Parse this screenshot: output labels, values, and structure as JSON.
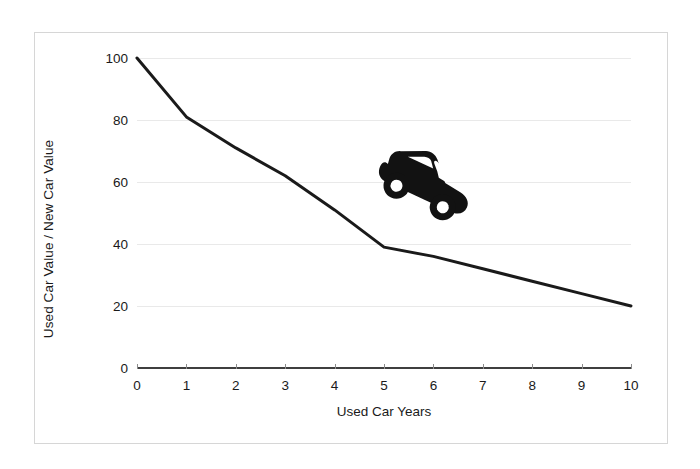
{
  "chart_data": {
    "type": "line",
    "title": "",
    "subtitle": "",
    "xlabel": "Used Car Years",
    "ylabel": "Used Car Value / New Car Value",
    "x": [
      0,
      1,
      2,
      3,
      4,
      5,
      6,
      7,
      8,
      9,
      10
    ],
    "values": [
      100,
      81,
      71,
      62,
      51,
      39,
      36,
      32,
      28,
      24,
      20
    ],
    "series": [
      {
        "name": "Used Car Value / New Car Value",
        "color": "#1a1a1a",
        "values": [
          100,
          81,
          71,
          62,
          51,
          39,
          36,
          32,
          28,
          24,
          20
        ]
      }
    ],
    "xlim": [
      0,
      10
    ],
    "ylim": [
      0,
      100
    ],
    "xticks": [
      "0",
      "1",
      "2",
      "3",
      "4",
      "5",
      "6",
      "7",
      "8",
      "9",
      "10"
    ],
    "yticks": [
      "0",
      "20",
      "40",
      "60",
      "80",
      "100"
    ],
    "ytick_values": [
      0,
      20,
      40,
      60,
      80,
      100
    ],
    "grid": true,
    "grid_axis": "y",
    "legend": false,
    "legend_position": "none",
    "annotations": [
      {
        "name": "car-icon",
        "type": "image",
        "description": "black car silhouette tilted nose-down, coasting down the depreciation curve",
        "x_range": [
          3.0,
          5.3
        ],
        "y_range": [
          57,
          77
        ]
      }
    ]
  },
  "figure": {
    "border_color": "#d6d6d6",
    "background": "#ffffff",
    "grid_color": "#e9e9e9",
    "axis_color": "#3f3f3f",
    "line_color": "#1a1a1a",
    "text_color": "#1a1a1a"
  },
  "icons": {
    "car": "car-icon"
  }
}
